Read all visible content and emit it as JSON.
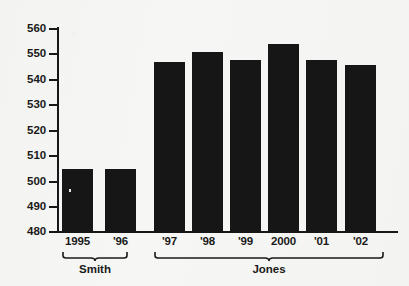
{
  "chart_data": {
    "type": "bar",
    "title": "",
    "subtitle": "",
    "xlabel": "",
    "ylabel": "",
    "categories": [
      "1995",
      "'96",
      "'97",
      "'98",
      "'99",
      "2000",
      "'01",
      "'02"
    ],
    "values": [
      505,
      505,
      547,
      551,
      548,
      554,
      548,
      546
    ],
    "ylim": [
      480,
      560
    ],
    "ytick_values": [
      480,
      490,
      500,
      510,
      520,
      530,
      540,
      550,
      560
    ],
    "ytick_labels": [
      "480",
      "490",
      "500",
      "510",
      "520",
      "530",
      "540",
      "550",
      "560"
    ],
    "grid": false,
    "legend": null,
    "bar_color": "#161616",
    "background_color": "#f6f6f4",
    "axis_color": "#171717",
    "groups": [
      {
        "label": "Smith",
        "categories": [
          "1995",
          "'96"
        ]
      },
      {
        "label": "Jones",
        "categories": [
          "'97",
          "'98",
          "'99",
          "2000",
          "'01",
          "'02"
        ]
      }
    ],
    "annotations": []
  },
  "axis": {
    "ticks": [
      {
        "label": "560",
        "value": 560
      },
      {
        "label": "550",
        "value": 550
      },
      {
        "label": "540",
        "value": 540
      },
      {
        "label": "530",
        "value": 530
      },
      {
        "label": "520",
        "value": 520
      },
      {
        "label": "510",
        "value": 510
      },
      {
        "label": "500",
        "value": 500
      },
      {
        "label": "490",
        "value": 490
      },
      {
        "label": "480",
        "value": 480
      }
    ]
  },
  "bars": [
    {
      "label": "1995",
      "value": 505
    },
    {
      "label": "'96",
      "value": 505
    },
    {
      "label": "'97",
      "value": 547
    },
    {
      "label": "'98",
      "value": 551
    },
    {
      "label": "'99",
      "value": 548
    },
    {
      "label": "2000",
      "value": 554
    },
    {
      "label": "'01",
      "value": 548
    },
    {
      "label": "'02",
      "value": 546
    }
  ],
  "groups": [
    {
      "label": "Smith"
    },
    {
      "label": "Jones"
    }
  ]
}
